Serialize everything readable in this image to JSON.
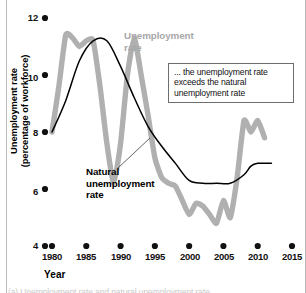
{
  "chart_data": {
    "type": "line",
    "title": "",
    "xlabel": "Year",
    "ylabel": "Unemployment rate (percentage of workforce)",
    "xlim": [
      1980,
      2015
    ],
    "ylim": [
      4,
      12
    ],
    "grid": false,
    "legend_position": "inline-annotations",
    "xticks": [
      1980,
      1985,
      1990,
      1995,
      2000,
      2005,
      2010,
      2015
    ],
    "yticks": [
      4,
      6,
      8,
      10,
      12
    ],
    "series": [
      {
        "name": "Unemployment rate",
        "color": "#b0b0b0",
        "x": [
          1980,
          1981,
          1982,
          1983,
          1984,
          1985,
          1986,
          1987,
          1988,
          1989,
          1990,
          1991,
          1992,
          1993,
          1994,
          1995,
          1996,
          1997,
          1998,
          1999,
          2000,
          2001,
          2002,
          2003,
          2004,
          2005,
          2006,
          2007,
          2008,
          2009,
          2010,
          2011
        ],
        "values": [
          8.0,
          9.6,
          11.4,
          11.3,
          11.0,
          11.2,
          11.2,
          9.6,
          7.6,
          6.2,
          7.6,
          10.0,
          11.3,
          10.0,
          8.6,
          7.1,
          6.4,
          6.2,
          6.1,
          5.6,
          5.1,
          5.5,
          5.4,
          5.1,
          4.8,
          5.6,
          5.0,
          6.4,
          8.4,
          8.0,
          8.4,
          7.8
        ]
      },
      {
        "name": "Natural unemployment rate",
        "color": "#000000",
        "x": [
          1980,
          1982,
          1984,
          1986,
          1988,
          1990,
          1992,
          1994,
          1996,
          1998,
          2000,
          2002,
          2004,
          2006,
          2008,
          2009,
          2010,
          2012
        ],
        "values": [
          8.0,
          9.1,
          10.5,
          11.2,
          11.2,
          10.3,
          9.2,
          8.2,
          7.5,
          6.9,
          6.3,
          6.2,
          6.2,
          6.2,
          6.5,
          6.8,
          6.9,
          6.9
        ]
      }
    ],
    "annotations": [
      {
        "name": "callout-exceeds",
        "text": "... the unemployment rate exceeds the natural unemployment rate"
      },
      {
        "name": "series-label-unemployment",
        "text": "Unemployment\nrate"
      },
      {
        "name": "series-label-natural",
        "text": "Natural\nunemployment\nrate"
      }
    ]
  },
  "axes": {
    "y_title_line1": "Unemployment rate",
    "y_title_line2": "(percentage of workforce)",
    "x_title": "Year",
    "y_ticks": [
      "12",
      "10",
      "8",
      "6",
      "4"
    ],
    "x_ticks": [
      "1980",
      "1985",
      "1990",
      "1995",
      "2000",
      "2005",
      "2010",
      "2015"
    ]
  },
  "labels": {
    "unemployment_line1": "Unemployment",
    "unemployment_line2": "rate",
    "natural_line1": "Natural",
    "natural_line2": "unemployment",
    "natural_line3": "rate"
  },
  "callout": {
    "line1": "... the unemployment",
    "line2": "rate exceeds the natural",
    "line3": "unemployment rate"
  },
  "colors": {
    "unemployment_series": "#b0b0b0",
    "natural_series": "#000000",
    "tick_dot": "#111111",
    "callout_border": "#6e6e6e"
  },
  "caption_sliver": "(a) Unemployment rate and natural unemployment rate"
}
